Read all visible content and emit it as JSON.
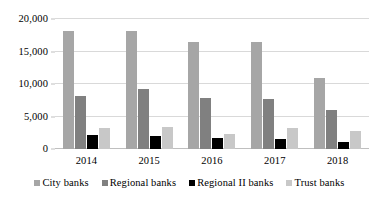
{
  "chart_data": {
    "type": "bar",
    "title": "",
    "subtitle": "",
    "xlabel": "",
    "ylabel": "",
    "categories": [
      "2014",
      "2015",
      "2016",
      "2017",
      "2018"
    ],
    "series": [
      {
        "name": "City banks",
        "color": "#A6A6A6",
        "values": [
          18200,
          18200,
          16400,
          16500,
          10900
        ]
      },
      {
        "name": "Regional banks",
        "color": "#808080",
        "values": [
          8100,
          9300,
          7900,
          7700,
          6000
        ]
      },
      {
        "name": "Regional II banks",
        "color": "#000000",
        "values": [
          2100,
          1950,
          1700,
          1500,
          1100
        ]
      },
      {
        "name": "Trust banks",
        "color": "#C8C8C8",
        "values": [
          3250,
          3400,
          2350,
          3300,
          2700
        ]
      }
    ],
    "ylim": [
      0,
      20000
    ],
    "ytick_values": [
      0,
      5000,
      10000,
      15000,
      20000
    ],
    "ytick_labels": [
      "0",
      "5,000",
      "10,000",
      "15,000",
      "20,000"
    ],
    "grid": true,
    "legend_position": "bottom",
    "gridline_color": "#D9D9D9",
    "baseline_color": "#BFBFBF",
    "background_color": "#FFFFFF"
  }
}
